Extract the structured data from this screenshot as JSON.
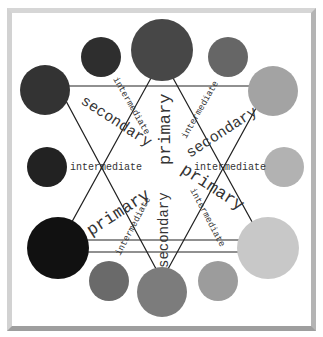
{
  "diagram": {
    "frame_color": "#c4c4c4",
    "line_color": "#222222",
    "circles": [
      {
        "id": "top-primary",
        "cx": 162,
        "cy": 50,
        "r": 31,
        "color": "#474747"
      },
      {
        "id": "top-left-intermediate",
        "cx": 101,
        "cy": 57,
        "r": 20,
        "color": "#2e2e2e"
      },
      {
        "id": "top-right-intermediate",
        "cx": 228,
        "cy": 57,
        "r": 20,
        "color": "#666666"
      },
      {
        "id": "left-secondary",
        "cx": 45,
        "cy": 90,
        "r": 25,
        "color": "#333333"
      },
      {
        "id": "right-secondary",
        "cx": 273,
        "cy": 91,
        "r": 25,
        "color": "#a3a3a3"
      },
      {
        "id": "left-intermediate",
        "cx": 47,
        "cy": 167,
        "r": 20,
        "color": "#222222"
      },
      {
        "id": "right-intermediate",
        "cx": 284,
        "cy": 167,
        "r": 20,
        "color": "#b2b2b2"
      },
      {
        "id": "bottom-left-primary",
        "cx": 58,
        "cy": 248,
        "r": 31,
        "color": "#111111"
      },
      {
        "id": "bottom-right-primary",
        "cx": 268,
        "cy": 248,
        "r": 31,
        "color": "#c8c8c8"
      },
      {
        "id": "bottom-left-intermediate",
        "cx": 109,
        "cy": 281,
        "r": 20,
        "color": "#6a6a6a"
      },
      {
        "id": "bottom-secondary",
        "cx": 162,
        "cy": 292,
        "r": 25,
        "color": "#7c7c7c"
      },
      {
        "id": "bottom-right-intermediate",
        "cx": 218,
        "cy": 281,
        "r": 20,
        "color": "#9c9c9c"
      }
    ],
    "labels": {
      "primary_top": "primary",
      "primary_left": "primary",
      "primary_right": "primary",
      "secondary_left": "secondary",
      "secondary_right": "secondary",
      "secondary_bottom": "secondary",
      "intermediate_top_left": "intermediate",
      "intermediate_top_right": "intermediate",
      "intermediate_left": "intermediate",
      "intermediate_right": "intermediate",
      "intermediate_bottom_left": "intermediate",
      "intermediate_bottom_right": "intermediate"
    }
  }
}
